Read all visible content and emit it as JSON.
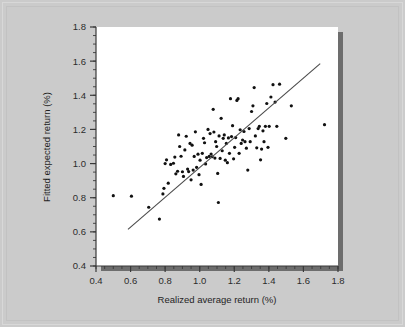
{
  "figure": {
    "background_color": "#cbcbcb",
    "panel_color": "#ffffff",
    "shadow_color": "#6d6d6d",
    "point_color": "#111111",
    "line_color": "#4a4a4a",
    "axis_color": "#3a3a3a"
  },
  "chart_data": {
    "type": "scatter",
    "title": "",
    "subtitle": "",
    "xlabel": "Realized average return (%)",
    "ylabel": "Fitted expected return (%)",
    "xlim": [
      0.4,
      1.8
    ],
    "ylim": [
      0.4,
      1.8
    ],
    "xticks": [
      0.4,
      0.6,
      0.8,
      1.0,
      1.2,
      1.4,
      1.6,
      1.8
    ],
    "yticks": [
      0.4,
      0.6,
      0.8,
      1.0,
      1.2,
      1.4,
      1.6,
      1.8
    ],
    "xtick_labels": [
      "0.4",
      "0.6",
      "0.8",
      "1.0",
      "1.2",
      "1.4",
      "1.6",
      "1.8"
    ],
    "ytick_labels": [
      "0.4",
      "0.6",
      "0.8",
      "1.0",
      "1.2",
      "1.4",
      "1.6",
      "1.8"
    ],
    "minor_tick_step": 0.05,
    "major_tick_step": 0.2,
    "grid": false,
    "legend": null,
    "legend_position": "none",
    "tick_direction": "out",
    "annotations": [],
    "fit_line": {
      "label": "fitted regression line",
      "x_start": 0.585,
      "y_start": 0.615,
      "x_end": 1.697,
      "y_end": 1.585
    },
    "series": [
      {
        "name": "portfolio",
        "marker": "filled-circle",
        "marker_size_px": 3.2,
        "color": "#111111",
        "points": [
          [
            0.5,
            0.812
          ],
          [
            0.605,
            0.809
          ],
          [
            0.705,
            0.744
          ],
          [
            0.767,
            0.675
          ],
          [
            0.787,
            0.822
          ],
          [
            0.793,
            0.855
          ],
          [
            0.8,
            1.0
          ],
          [
            0.808,
            1.022
          ],
          [
            0.818,
            0.885
          ],
          [
            0.832,
            0.995
          ],
          [
            0.848,
            1.002
          ],
          [
            0.856,
            1.038
          ],
          [
            0.862,
            0.94
          ],
          [
            0.872,
            0.955
          ],
          [
            0.878,
            1.168
          ],
          [
            0.884,
            1.1
          ],
          [
            0.892,
            1.043
          ],
          [
            0.9,
            0.952
          ],
          [
            0.906,
            0.925
          ],
          [
            0.914,
            1.08
          ],
          [
            0.922,
            1.16
          ],
          [
            0.93,
            0.968
          ],
          [
            0.936,
            0.953
          ],
          [
            0.944,
            1.118
          ],
          [
            0.95,
            0.905
          ],
          [
            0.956,
            1.108
          ],
          [
            0.962,
            0.962
          ],
          [
            0.968,
            1.042
          ],
          [
            0.975,
            1.186
          ],
          [
            0.982,
            0.978
          ],
          [
            0.99,
            1.055
          ],
          [
            0.996,
            0.935
          ],
          [
            1.002,
            1.02
          ],
          [
            1.008,
            0.878
          ],
          [
            1.015,
            1.06
          ],
          [
            1.022,
            1.148
          ],
          [
            1.028,
            1.122
          ],
          [
            1.034,
            0.998
          ],
          [
            1.04,
            1.035
          ],
          [
            1.048,
            1.2
          ],
          [
            1.055,
            1.042
          ],
          [
            1.06,
            1.176
          ],
          [
            1.066,
            1.056
          ],
          [
            1.072,
            1.04
          ],
          [
            1.078,
            1.318
          ],
          [
            1.082,
            1.185
          ],
          [
            1.088,
            1.032
          ],
          [
            1.092,
            1.128
          ],
          [
            1.098,
            1.1
          ],
          [
            1.104,
            0.942
          ],
          [
            1.108,
            0.772
          ],
          [
            1.112,
            1.162
          ],
          [
            1.118,
            1.03
          ],
          [
            1.124,
            1.265
          ],
          [
            1.13,
            1.075
          ],
          [
            1.136,
            1.148
          ],
          [
            1.142,
            1.168
          ],
          [
            1.148,
            1.02
          ],
          [
            1.154,
            1.118
          ],
          [
            1.16,
            1.005
          ],
          [
            1.166,
            1.15
          ],
          [
            1.172,
            1.06
          ],
          [
            1.178,
            1.38
          ],
          [
            1.184,
            1.158
          ],
          [
            1.19,
            1.222
          ],
          [
            1.196,
            1.028
          ],
          [
            1.202,
            1.095
          ],
          [
            1.208,
            1.152
          ],
          [
            1.215,
            1.37
          ],
          [
            1.222,
            1.38
          ],
          [
            1.228,
            1.06
          ],
          [
            1.234,
            1.198
          ],
          [
            1.24,
            1.118
          ],
          [
            1.248,
            1.138
          ],
          [
            1.256,
            1.188
          ],
          [
            1.262,
            1.128
          ],
          [
            1.27,
            1.09
          ],
          [
            1.278,
            0.962
          ],
          [
            1.286,
            1.205
          ],
          [
            1.292,
            1.128
          ],
          [
            1.3,
            1.305
          ],
          [
            1.308,
            1.338
          ],
          [
            1.315,
            1.445
          ],
          [
            1.322,
            1.162
          ],
          [
            1.33,
            1.092
          ],
          [
            1.338,
            1.205
          ],
          [
            1.345,
            1.218
          ],
          [
            1.352,
            1.022
          ],
          [
            1.358,
            1.085
          ],
          [
            1.366,
            1.192
          ],
          [
            1.372,
            1.128
          ],
          [
            1.38,
            1.218
          ],
          [
            1.388,
            1.352
          ],
          [
            1.395,
            1.095
          ],
          [
            1.402,
            1.218
          ],
          [
            1.412,
            1.39
          ],
          [
            1.424,
            1.462
          ],
          [
            1.436,
            1.36
          ],
          [
            1.446,
            1.218
          ],
          [
            1.462,
            1.465
          ],
          [
            1.498,
            1.148
          ],
          [
            1.53,
            1.338
          ],
          [
            1.722,
            1.228
          ]
        ]
      }
    ]
  }
}
